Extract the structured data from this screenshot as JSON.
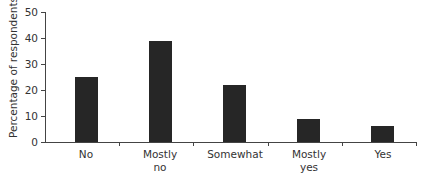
{
  "chart_data": {
    "type": "bar",
    "title": "",
    "xlabel": "",
    "ylabel": "Percentage of respondents",
    "categories": [
      "No",
      "Mostly no",
      "Somewhat",
      "Mostly yes",
      "Yes"
    ],
    "category_lines": [
      [
        "No",
        ""
      ],
      [
        "Mostly",
        "no"
      ],
      [
        "Somewhat",
        ""
      ],
      [
        "Mostly",
        "yes"
      ],
      [
        "Yes",
        ""
      ]
    ],
    "values": [
      25,
      39,
      22,
      9,
      6
    ],
    "ylim": [
      0,
      50
    ],
    "yticks": [
      0,
      10,
      20,
      30,
      40,
      50
    ],
    "grid": false,
    "legend": null,
    "bar_color": "#262626"
  }
}
